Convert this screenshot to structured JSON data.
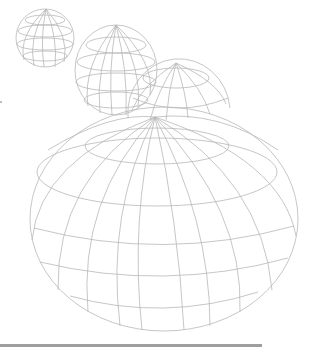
{
  "illustration": {
    "subject": "wireframe globes",
    "stroke_color": "#b8b8b8",
    "background": "#ffffff",
    "globes": [
      {
        "name": "globe-small",
        "cx": 45,
        "cy": 38,
        "rx": 29,
        "ry": 29,
        "pole_x": 46,
        "pole_y": 12,
        "meridians": 8,
        "parallels": 4
      },
      {
        "name": "globe-medium",
        "cx": 116,
        "cy": 70,
        "rx": 41,
        "ry": 43,
        "pole_x": 116,
        "pole_y": 25,
        "meridians": 8,
        "parallels": 4
      },
      {
        "name": "globe-large",
        "cx": 179,
        "cy": 96,
        "rx": 51,
        "ry": 40,
        "pole_x": 176,
        "pole_y": 64,
        "meridians": 10,
        "parallels": 3
      },
      {
        "name": "globe-xlarge",
        "cx": 164,
        "cy": 218,
        "rx": 134,
        "ry": 112,
        "pole_x": 155,
        "pole_y": 117,
        "meridians": 12,
        "parallels": 5
      }
    ]
  },
  "footer_bar": {
    "color": "#9e9e9e",
    "width": 262
  }
}
